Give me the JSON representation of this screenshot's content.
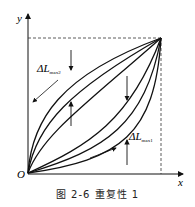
{
  "figure": {
    "caption": "图 2-6   重复性 1",
    "axis_x_label": "x",
    "axis_y_label": "y",
    "origin_label": "O",
    "annotation_max2": "ΔL",
    "annotation_max2_sub": "max2",
    "annotation_max1": "ΔL",
    "annotation_max1_sub": "max1"
  },
  "colors": {
    "stroke": "#111111",
    "background": "#ffffff"
  }
}
